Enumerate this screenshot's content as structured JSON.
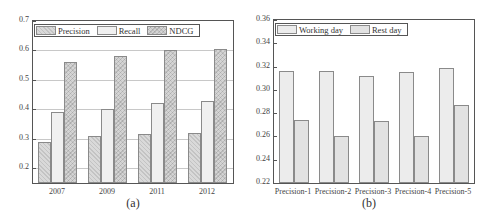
{
  "chart_data": [
    {
      "id": "a",
      "type": "bar",
      "caption": "(a)",
      "categories": [
        "2007",
        "2009",
        "2011",
        "2012"
      ],
      "series": [
        {
          "name": "Precision",
          "values": [
            0.29,
            0.31,
            0.315,
            0.32
          ]
        },
        {
          "name": "Recall",
          "values": [
            0.39,
            0.4,
            0.42,
            0.43
          ]
        },
        {
          "name": "NDCG",
          "values": [
            0.56,
            0.58,
            0.6,
            0.605
          ]
        }
      ],
      "xlabel": "",
      "ylabel": "",
      "ylim": [
        0.15,
        0.7
      ],
      "yticks": [
        "0.7",
        "0.6",
        "0.5",
        "0.4",
        "0.3",
        "0.2"
      ],
      "grid": true,
      "legend_position": "top-left, horizontal"
    },
    {
      "id": "b",
      "type": "bar",
      "caption": "(b)",
      "categories": [
        "Precision-1",
        "Precision-2",
        "Precision-3",
        "Precision-4",
        "Precision-5"
      ],
      "series": [
        {
          "name": "Working day",
          "values": [
            0.316,
            0.316,
            0.312,
            0.315,
            0.319
          ]
        },
        {
          "name": "Rest day",
          "values": [
            0.274,
            0.26,
            0.273,
            0.26,
            0.287
          ]
        }
      ],
      "xlabel": "",
      "ylabel": "",
      "ylim": [
        0.22,
        0.36
      ],
      "yticks": [
        "0.36",
        "0.34",
        "0.32",
        "0.30",
        "0.28",
        "0.26",
        "0.24",
        "0.22"
      ],
      "grid": false,
      "legend_position": "top-left, horizontal"
    }
  ],
  "charts": {
    "a": {
      "caption": "(a)",
      "legend": [
        "Precision",
        "Recall",
        "NDCG"
      ],
      "xticks": [
        "2007",
        "2009",
        "2011",
        "2012"
      ],
      "yticks": [
        "0.7",
        "0.6",
        "0.5",
        "0.4",
        "0.3",
        "0.2"
      ]
    },
    "b": {
      "caption": "(b)",
      "legend": [
        "Working day",
        "Rest day"
      ],
      "xticks": [
        "Precision-1",
        "Precision-2",
        "Precision-3",
        "Precision-4",
        "Precision-5"
      ],
      "yticks": [
        "0.36",
        "0.34",
        "0.32",
        "0.30",
        "0.28",
        "0.26",
        "0.24",
        "0.22"
      ]
    }
  }
}
